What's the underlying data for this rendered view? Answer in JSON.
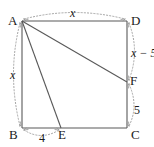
{
  "figure": {
    "type": "geometry-diagram",
    "shape": "square",
    "stroke_color": "#595959",
    "dashed_color": "#9a9a9a",
    "text_color": "#1a1a1a",
    "background_color": "#ffffff",
    "vertices": [
      {
        "id": "A",
        "label": "A",
        "x": 22,
        "y": 21,
        "label_x": 8,
        "label_y": 14
      },
      {
        "id": "D",
        "label": "D",
        "x": 127,
        "y": 21,
        "label_x": 131,
        "label_y": 14
      },
      {
        "id": "C",
        "label": "C",
        "x": 127,
        "y": 128,
        "label_x": 131,
        "label_y": 128
      },
      {
        "id": "B",
        "label": "B",
        "x": 22,
        "y": 128,
        "label_x": 9,
        "label_y": 128
      },
      {
        "id": "E",
        "label": "E",
        "x": 61,
        "y": 128,
        "label_x": 58,
        "label_y": 128
      },
      {
        "id": "F",
        "label": "F",
        "x": 127,
        "y": 82,
        "label_x": 130,
        "label_y": 74
      }
    ],
    "solid_segments": [
      {
        "name": "side-AD",
        "from": "A",
        "to": "D"
      },
      {
        "name": "side-DC",
        "from": "D",
        "to": "C"
      },
      {
        "name": "side-CB",
        "from": "C",
        "to": "B"
      },
      {
        "name": "side-BA",
        "from": "B",
        "to": "A"
      },
      {
        "name": "segment-AF",
        "from": "A",
        "to": "F"
      },
      {
        "name": "segment-AE",
        "from": "A",
        "to": "E"
      }
    ],
    "measures": [
      {
        "id": "AD",
        "label": "x",
        "italic": true,
        "from": "A",
        "to": "D",
        "side": "top",
        "label_x": 70,
        "label_y": 7
      },
      {
        "id": "AB",
        "label": "x",
        "italic": true,
        "from": "A",
        "to": "B",
        "side": "left",
        "label_x": 10,
        "label_y": 69
      },
      {
        "id": "DF",
        "label": "x − 5",
        "italic": true,
        "from": "D",
        "to": "F",
        "side": "right",
        "label_x": 131,
        "label_y": 47
      },
      {
        "id": "FC",
        "label": "5",
        "italic": false,
        "from": "F",
        "to": "C",
        "side": "right",
        "label_x": 134,
        "label_y": 104
      },
      {
        "id": "BE",
        "label": "4",
        "italic": false,
        "from": "B",
        "to": "E",
        "side": "bottom",
        "label_x": 39,
        "label_y": 132
      }
    ]
  }
}
